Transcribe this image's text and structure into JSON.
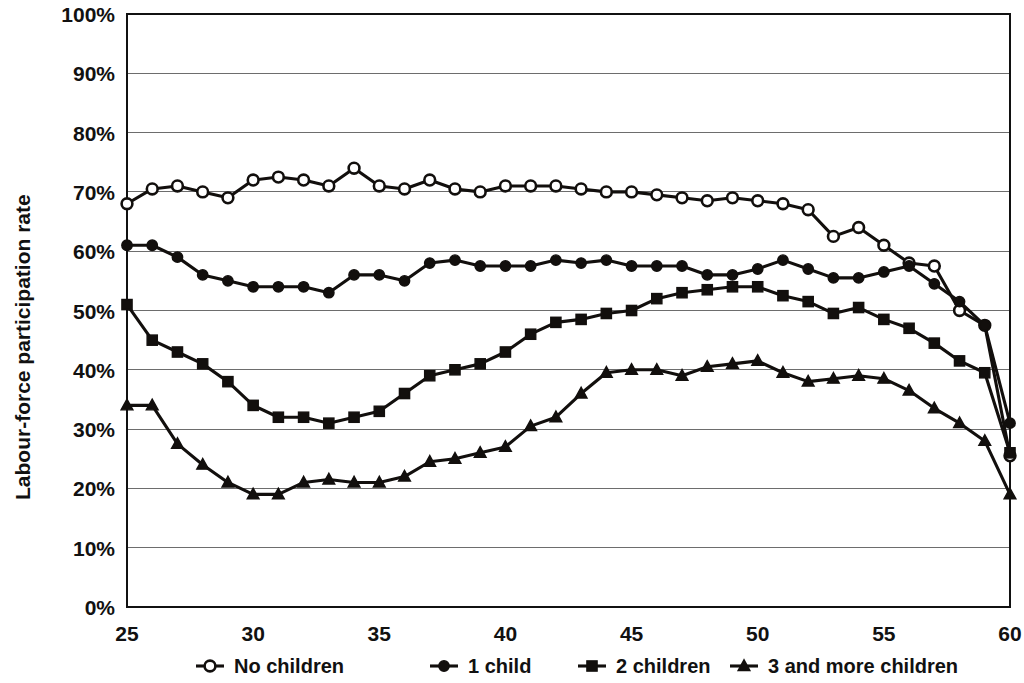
{
  "chart_data": {
    "type": "line",
    "title": "",
    "xlabel": "",
    "ylabel": "Labour-force participation rate",
    "xlim": [
      25,
      60
    ],
    "ylim": [
      0,
      1.0
    ],
    "grid": true,
    "legend_position": "bottom",
    "x_tick_labels": [
      "25",
      "30",
      "35",
      "40",
      "45",
      "50",
      "55",
      "60"
    ],
    "x_ticks": [
      25,
      30,
      35,
      40,
      45,
      50,
      55,
      60
    ],
    "y_tick_labels": [
      "0%",
      "10%",
      "20%",
      "30%",
      "40%",
      "50%",
      "60%",
      "70%",
      "80%",
      "90%",
      "100%"
    ],
    "y_ticks": [
      0,
      10,
      20,
      30,
      40,
      50,
      60,
      70,
      80,
      90,
      100
    ],
    "x": [
      25,
      26,
      27,
      28,
      29,
      30,
      31,
      32,
      33,
      34,
      35,
      36,
      37,
      38,
      39,
      40,
      41,
      42,
      43,
      44,
      45,
      46,
      47,
      48,
      49,
      50,
      51,
      52,
      53,
      54,
      55,
      56,
      57,
      58,
      59,
      60
    ],
    "series": [
      {
        "name": "No children",
        "marker": "open-circle",
        "values": [
          68,
          70.5,
          71,
          70,
          69,
          72,
          72.5,
          72,
          71,
          74,
          71,
          70.5,
          72,
          70.5,
          70,
          71,
          71,
          71,
          70.5,
          70,
          70,
          69.5,
          69,
          68.5,
          69,
          68.5,
          68,
          67,
          62.5,
          64,
          61,
          58,
          57.5,
          50,
          47.5,
          25.5
        ]
      },
      {
        "name": "1 child",
        "marker": "filled-circle",
        "values": [
          61,
          61,
          59,
          56,
          55,
          54,
          54,
          54,
          53,
          56,
          56,
          55,
          58,
          58.5,
          57.5,
          57.5,
          57.5,
          58.5,
          58,
          58.5,
          57.5,
          57.5,
          57.5,
          56,
          56,
          57,
          58.5,
          57,
          55.5,
          55.5,
          56.5,
          57.5,
          54.5,
          51.5,
          47.5,
          31
        ]
      },
      {
        "name": "2 children",
        "marker": "filled-square",
        "values": [
          51,
          45,
          43,
          41,
          38,
          34,
          32,
          32,
          31,
          32,
          33,
          36,
          39,
          40,
          41,
          43,
          46,
          48,
          48.5,
          49.5,
          50,
          52,
          53,
          53.5,
          54,
          54,
          52.5,
          51.5,
          49.5,
          50.5,
          48.5,
          47,
          44.5,
          41.5,
          39.5,
          26
        ]
      },
      {
        "name": "3 and more children",
        "marker": "filled-triangle",
        "values": [
          34,
          34,
          27.5,
          24,
          21,
          19,
          19,
          21,
          21.5,
          21,
          21,
          22,
          24.5,
          25,
          26,
          27,
          30.5,
          32,
          36,
          39.5,
          40,
          40,
          39,
          40.5,
          41,
          41.5,
          39.5,
          38,
          38.5,
          39,
          38.5,
          36.5,
          33.5,
          31,
          28,
          19
        ]
      }
    ]
  },
  "legend": {
    "items": [
      {
        "label": "No children",
        "marker": "open-circle"
      },
      {
        "label": "1 child",
        "marker": "filled-circle"
      },
      {
        "label": "2 children",
        "marker": "filled-square"
      },
      {
        "label": "3 and more children",
        "marker": "filled-triangle"
      }
    ]
  },
  "colors": {
    "ink": "#120f0d",
    "grid": "#6d6d6d",
    "background": "#ffffff"
  }
}
